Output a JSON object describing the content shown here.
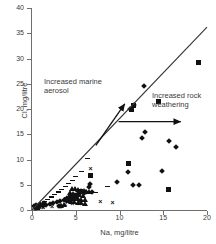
{
  "chart_data": {
    "type": "scatter",
    "title": "",
    "xlabel": "Na, mg/litre",
    "ylabel": "Cl, mg/litre",
    "xlim": [
      0,
      20
    ],
    "ylim": [
      0,
      40
    ],
    "xticks": [
      0,
      5,
      10,
      15,
      20
    ],
    "yticks": [
      0,
      5,
      10,
      15,
      20,
      25,
      30,
      35,
      40
    ],
    "grid": false,
    "legend": "none",
    "reference_line": {
      "name": "1:1 marine ratio line",
      "from": [
        0,
        0
      ],
      "to": [
        20,
        36.2
      ]
    },
    "annotations": [
      {
        "id": "marine-aerosol",
        "text": "Increased marine aerosol",
        "arrow": "diagonal-up-right",
        "arrow_from": [
          7.3,
          12.8
        ],
        "arrow_to": [
          10.6,
          21.0
        ]
      },
      {
        "id": "rock-weathering",
        "text": "Increased rock weathering",
        "arrow": "horizontal-right",
        "arrow_from": [
          9.9,
          17.5
        ],
        "arrow_to": [
          17.0,
          17.5
        ]
      }
    ],
    "series": [
      {
        "name": "diamond-series",
        "marker": "diamond",
        "color": "#111111",
        "points": [
          [
            12.8,
            24.6
          ],
          [
            11.6,
            20.7
          ],
          [
            11.2,
            20.0
          ],
          [
            12.9,
            15.4
          ],
          [
            12.6,
            14.3
          ],
          [
            15.7,
            13.7
          ],
          [
            16.5,
            12.5
          ],
          [
            14.9,
            7.8
          ],
          [
            11.0,
            7.5
          ],
          [
            9.7,
            5.6
          ],
          [
            11.5,
            4.9
          ],
          [
            12.2,
            5.0
          ],
          [
            6.6,
            5.2
          ],
          [
            6.5,
            4.6
          ],
          [
            6.8,
            3.6
          ],
          [
            6.2,
            3.5
          ],
          [
            5.9,
            3.4
          ],
          [
            5.5,
            3.3
          ],
          [
            5.2,
            3.1
          ],
          [
            4.9,
            2.9
          ],
          [
            4.6,
            2.7
          ],
          [
            4.3,
            2.5
          ],
          [
            4.0,
            2.3
          ],
          [
            3.6,
            2.0
          ],
          [
            3.2,
            1.8
          ],
          [
            2.8,
            1.5
          ],
          [
            2.4,
            1.3
          ],
          [
            2.0,
            1.1
          ],
          [
            1.6,
            0.9
          ],
          [
            1.2,
            0.7
          ],
          [
            0.8,
            0.5
          ],
          [
            0.5,
            0.4
          ],
          [
            0.3,
            0.3
          ],
          [
            0.2,
            0.8
          ],
          [
            0.4,
            1.0
          ],
          [
            0.9,
            1.2
          ],
          [
            1.4,
            1.4
          ],
          [
            3.1,
            0.7
          ],
          [
            3.3,
            0.8
          ]
        ]
      },
      {
        "name": "square-series",
        "marker": "square",
        "color": "#111111",
        "points": [
          [
            19.0,
            29.2
          ],
          [
            11.4,
            20.0
          ],
          [
            11.6,
            20.6
          ],
          [
            15.6,
            4.0
          ],
          [
            14.4,
            21.4
          ],
          [
            11.0,
            9.3
          ],
          [
            6.7,
            6.8
          ],
          [
            5.5,
            3.7
          ],
          [
            5.0,
            2.6
          ],
          [
            4.4,
            2.3
          ],
          [
            3.9,
            2.0
          ],
          [
            0.6,
            0.4
          ]
        ]
      },
      {
        "name": "triangle-series",
        "marker": "triangle",
        "color": "#111111",
        "points": [
          [
            4.6,
            4.3
          ],
          [
            4.9,
            4.2
          ],
          [
            5.2,
            4.0
          ],
          [
            5.6,
            3.9
          ],
          [
            5.9,
            3.8
          ],
          [
            6.2,
            3.7
          ],
          [
            6.5,
            3.6
          ],
          [
            4.3,
            3.4
          ],
          [
            4.7,
            3.2
          ],
          [
            5.1,
            3.1
          ],
          [
            5.4,
            3.0
          ],
          [
            5.8,
            2.9
          ],
          [
            4.2,
            2.6
          ],
          [
            4.5,
            2.4
          ],
          [
            4.8,
            2.3
          ],
          [
            5.2,
            2.2
          ],
          [
            5.6,
            2.1
          ],
          [
            6.0,
            2.0
          ],
          [
            4.1,
            1.8
          ],
          [
            4.4,
            1.7
          ],
          [
            4.8,
            1.6
          ],
          [
            5.2,
            1.5
          ],
          [
            5.6,
            1.4
          ],
          [
            6.0,
            1.3
          ],
          [
            3.3,
            0.9
          ],
          [
            3.6,
            1.0
          ]
        ]
      },
      {
        "name": "x-series",
        "marker": "x",
        "color": "#111111",
        "points": [
          [
            6.7,
            8.1
          ],
          [
            7.8,
            1.5
          ],
          [
            9.2,
            1.4
          ],
          [
            3.1,
            0.6
          ],
          [
            2.3,
            0.5
          ],
          [
            1.3,
            0.4
          ],
          [
            0.9,
            0.4
          ],
          [
            5.4,
            1.2
          ],
          [
            4.6,
            1.1
          ],
          [
            3.8,
            0.9
          ]
        ]
      },
      {
        "name": "dash-series",
        "marker": "dash",
        "color": "#111111",
        "points": [
          [
            6.3,
            10.2
          ],
          [
            5.6,
            7.6
          ],
          [
            5.0,
            6.6
          ],
          [
            4.6,
            5.9
          ],
          [
            4.2,
            5.3
          ],
          [
            3.8,
            4.6
          ],
          [
            3.4,
            4.1
          ],
          [
            3.0,
            3.6
          ],
          [
            2.6,
            3.1
          ],
          [
            2.2,
            2.6
          ],
          [
            1.8,
            2.1
          ],
          [
            1.4,
            1.7
          ],
          [
            1.0,
            1.3
          ],
          [
            0.7,
            1.0
          ],
          [
            8.6,
            4.6
          ],
          [
            7.2,
            3.5
          ]
        ]
      }
    ]
  }
}
